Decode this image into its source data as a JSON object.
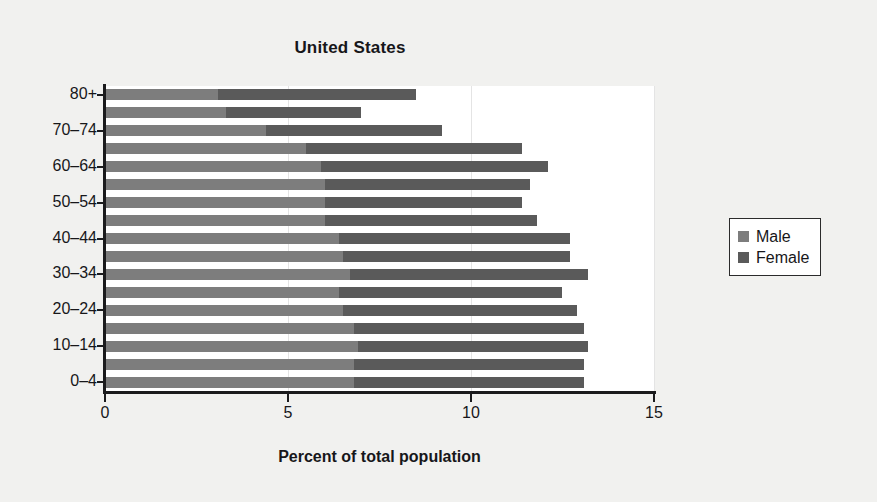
{
  "chart_data": {
    "type": "bar",
    "orientation": "horizontal",
    "stacked": true,
    "title": "United States",
    "xlabel": "Percent of total population",
    "ylabel": "",
    "xlim": [
      0,
      15
    ],
    "xticks": [
      0,
      5,
      10,
      15
    ],
    "xtick_labels": [
      "0",
      "5",
      "10",
      "15"
    ],
    "grid": true,
    "legend_position": "right",
    "categories": [
      "0–4",
      "5–9",
      "10–14",
      "15–19",
      "20–24",
      "25–29",
      "30–34",
      "35–39",
      "40–44",
      "45–49",
      "50–54",
      "55–59",
      "60–64",
      "65–69",
      "70–74",
      "75–79",
      "80+"
    ],
    "ytick_labels": [
      "0–4",
      "10–14",
      "20–24",
      "30–34",
      "40–44",
      "50–54",
      "60–64",
      "70–74",
      "80+"
    ],
    "series": [
      {
        "name": "Male",
        "color": "#7d7d7d",
        "values": [
          6.8,
          6.8,
          6.9,
          6.8,
          6.5,
          6.4,
          6.7,
          6.5,
          6.4,
          6.0,
          6.0,
          6.0,
          5.9,
          5.5,
          4.4,
          3.3,
          3.1
        ]
      },
      {
        "name": "Female",
        "color": "#5a5a5a",
        "values": [
          6.3,
          6.3,
          6.3,
          6.3,
          6.4,
          6.1,
          6.5,
          6.2,
          6.3,
          5.8,
          5.4,
          5.6,
          6.2,
          5.9,
          4.8,
          3.7,
          5.4
        ]
      }
    ],
    "totals": [
      13.1,
      13.1,
      13.2,
      13.1,
      12.9,
      12.5,
      13.2,
      12.7,
      12.7,
      11.8,
      11.4,
      11.6,
      12.1,
      11.4,
      9.2,
      7.0,
      8.5
    ]
  },
  "legend": {
    "items": [
      {
        "label": "Male",
        "color": "#7d7d7d"
      },
      {
        "label": "Female",
        "color": "#5a5a5a"
      }
    ]
  },
  "colors": {
    "background": "#f1f1ef",
    "plot_background": "#ffffff",
    "axis": "#1b1b1d",
    "text": "#17171a",
    "male": "#7d7d7d",
    "female": "#5a5a5a",
    "grid": "#e4e4e4"
  }
}
